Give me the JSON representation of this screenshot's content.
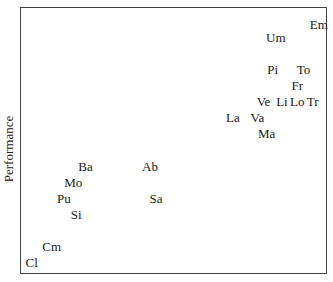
{
  "chart_data": {
    "type": "scatter",
    "title": "",
    "xlabel": "",
    "ylabel": "Performance",
    "xlim": [
      0,
      100
    ],
    "ylim": [
      0,
      100
    ],
    "grid": false,
    "legend": null,
    "marker": "text-label",
    "points": [
      {
        "label": "Em",
        "x": 97,
        "y": 94
      },
      {
        "label": "Um",
        "x": 83,
        "y": 89
      },
      {
        "label": "Pi",
        "x": 82,
        "y": 77
      },
      {
        "label": "To",
        "x": 92,
        "y": 77
      },
      {
        "label": "Fr",
        "x": 90,
        "y": 71
      },
      {
        "label": "Ve",
        "x": 79,
        "y": 65
      },
      {
        "label": "Li",
        "x": 85,
        "y": 65
      },
      {
        "label": "Lo",
        "x": 90,
        "y": 65
      },
      {
        "label": "Tr",
        "x": 95,
        "y": 65
      },
      {
        "label": "La",
        "x": 69,
        "y": 59
      },
      {
        "label": "Va",
        "x": 77,
        "y": 59
      },
      {
        "label": "Ma",
        "x": 80,
        "y": 53
      },
      {
        "label": "Ba",
        "x": 21,
        "y": 41
      },
      {
        "label": "Ab",
        "x": 42,
        "y": 41
      },
      {
        "label": "Mo",
        "x": 17,
        "y": 35
      },
      {
        "label": "Pu",
        "x": 14,
        "y": 29
      },
      {
        "label": "Sa",
        "x": 44,
        "y": 29
      },
      {
        "label": "Si",
        "x": 18,
        "y": 23
      },
      {
        "label": "Cm",
        "x": 10,
        "y": 11
      },
      {
        "label": "Cl",
        "x": 3.5,
        "y": 5
      }
    ]
  }
}
